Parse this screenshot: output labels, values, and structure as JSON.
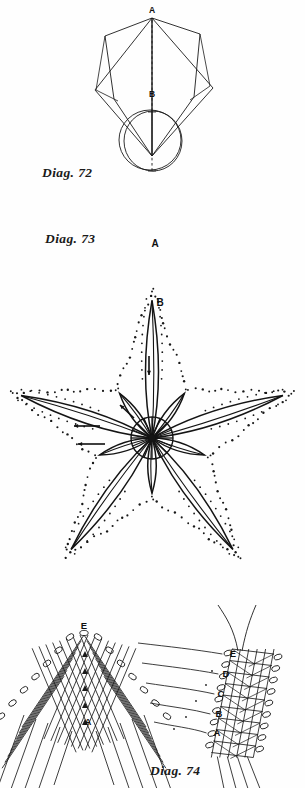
{
  "page": {
    "kind": "book-plate",
    "background_color": "#fefefe",
    "ink_color": "#1b1b1b"
  },
  "figures": [
    {
      "id": "diag-72",
      "caption": "Diag. 72",
      "description": "Folded square and folded circle shown with a dashed fold line from A to B",
      "labels": [
        {
          "text": "A",
          "x": 152,
          "y": 12
        },
        {
          "text": "B",
          "x": 152,
          "y": 92
        }
      ],
      "parts": [
        "overlapping-square-fold",
        "overlapping-circle-fold",
        "dashed-centre-line"
      ]
    },
    {
      "id": "diag-73",
      "caption": "Diag. 73",
      "description": "Five pointed star worked in needle lace; dotted outline of the star with solid worked rays and a spoked centre wheel",
      "labels": [
        {
          "text": "A",
          "x": 155,
          "y": 243
        },
        {
          "text": "B",
          "x": 160,
          "y": 302
        }
      ],
      "star": {
        "points": 5,
        "centre_x": 152,
        "centre_y": 438,
        "outer_radius": 148,
        "inner_radius": 60,
        "rays": 10,
        "centre_wheel_radius": 21,
        "centre_wheel_spokes": 16
      },
      "arrows": [
        {
          "name": "arrow-down-top-ray",
          "direction": "down"
        },
        {
          "name": "arrow-left-upper",
          "direction": "left"
        },
        {
          "name": "arrow-left-lower",
          "direction": "left"
        },
        {
          "name": "arrow-up-centre",
          "direction": "up-left"
        }
      ]
    },
    {
      "id": "diag-74",
      "caption": "Diag. 74",
      "description": "Two enlarged stitch details of the lattice filling with looped picot edges",
      "left_detail": {
        "name": "chevron-lattice-detail",
        "labels": [
          {
            "text": "E",
            "x": 84,
            "y": 626
          },
          {
            "text": "A",
            "x": 86,
            "y": 724
          }
        ]
      },
      "right_detail": {
        "name": "column-lattice-detail",
        "labels": [
          {
            "text": "E",
            "x": 232,
            "y": 654
          },
          {
            "text": "D",
            "x": 226,
            "y": 672
          },
          {
            "text": "C",
            "x": 222,
            "y": 692
          },
          {
            "text": "B",
            "x": 221,
            "y": 712
          },
          {
            "text": "A",
            "x": 219,
            "y": 731
          }
        ]
      }
    }
  ],
  "captions": {
    "diag_72": "Diag. 72",
    "diag_73": "Diag. 73",
    "diag_74": "Diag. 74"
  }
}
